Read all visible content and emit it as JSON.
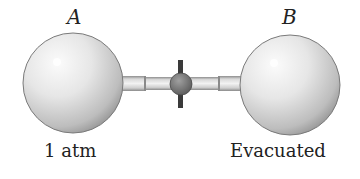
{
  "diagram": {
    "flask_a": {
      "letter": "A",
      "caption": "1 atm"
    },
    "flask_b": {
      "letter": "B",
      "caption": "Evacuated"
    },
    "valve": {
      "state": "closed"
    },
    "colors": {
      "sphere_light": "#f4f4f4",
      "sphere_dark": "#9a9a9a",
      "tube": "#d8d8d8",
      "valve": "#6f6f6f",
      "valve_stem": "#3a3a3a",
      "text": "#222222"
    }
  }
}
